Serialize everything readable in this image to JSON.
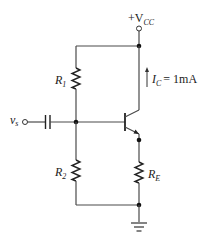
{
  "diagram": {
    "type": "BJT common-emitter voltage-divider bias circuit",
    "supply": {
      "prefix": "+V",
      "subscript": "CC"
    },
    "input": {
      "symbol": "v",
      "subscript": "s"
    },
    "resistors": [
      {
        "symbol": "R",
        "subscript": "1"
      },
      {
        "symbol": "R",
        "subscript": "2"
      },
      {
        "symbol": "R",
        "subscript": "E"
      }
    ],
    "collector_current": {
      "symbol": "I",
      "subscript": "C",
      "value": "= 1mA"
    },
    "components": [
      "coupling-capacitor",
      "npn-transistor",
      "ground"
    ]
  }
}
